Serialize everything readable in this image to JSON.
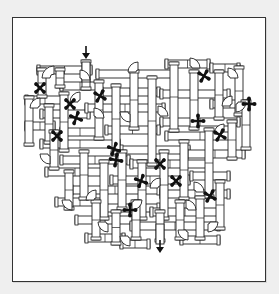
{
  "puzzle": {
    "type": "pipe-maze",
    "colors": {
      "background": "#efefef",
      "panel": "#ffffff",
      "border": "#333333",
      "ink": "#111111"
    },
    "entry_arrow": {
      "x": 86,
      "y": 52,
      "direction": "down"
    },
    "exit_arrow": {
      "x": 160,
      "y": 246,
      "direction": "down"
    },
    "pipes_horizontal": [
      [
        37,
        66,
        55,
        8
      ],
      [
        96,
        70,
        80,
        8
      ],
      [
        165,
        60,
        45,
        8
      ],
      [
        210,
        64,
        30,
        8
      ],
      [
        25,
        96,
        40,
        8
      ],
      [
        60,
        82,
        40,
        8
      ],
      [
        100,
        88,
        60,
        8
      ],
      [
        160,
        90,
        70,
        8
      ],
      [
        210,
        100,
        40,
        8
      ],
      [
        40,
        110,
        50,
        8
      ],
      [
        85,
        104,
        80,
        8
      ],
      [
        160,
        118,
        80,
        8
      ],
      [
        25,
        122,
        30,
        8
      ],
      [
        60,
        128,
        40,
        8
      ],
      [
        105,
        126,
        55,
        8
      ],
      [
        165,
        132,
        70,
        8
      ],
      [
        40,
        140,
        80,
        8
      ],
      [
        120,
        146,
        70,
        8
      ],
      [
        185,
        150,
        60,
        8
      ],
      [
        60,
        156,
        70,
        8
      ],
      [
        130,
        160,
        80,
        8
      ],
      [
        45,
        168,
        60,
        8
      ],
      [
        110,
        176,
        80,
        8
      ],
      [
        190,
        172,
        40,
        8
      ],
      [
        70,
        186,
        90,
        8
      ],
      [
        160,
        190,
        70,
        8
      ],
      [
        55,
        198,
        50,
        8
      ],
      [
        100,
        204,
        60,
        8
      ],
      [
        150,
        208,
        70,
        8
      ],
      [
        75,
        216,
        60,
        8
      ],
      [
        130,
        222,
        90,
        8
      ],
      [
        85,
        234,
        40,
        8
      ],
      [
        180,
        236,
        40,
        8
      ],
      [
        120,
        240,
        30,
        8
      ]
    ],
    "pipes_vertical": [
      [
        82,
        60,
        8,
        30
      ],
      [
        38,
        68,
        8,
        30
      ],
      [
        56,
        68,
        8,
        20
      ],
      [
        25,
        96,
        8,
        50
      ],
      [
        45,
        104,
        8,
        40
      ],
      [
        60,
        92,
        8,
        60
      ],
      [
        95,
        80,
        8,
        60
      ],
      [
        112,
        84,
        8,
        70
      ],
      [
        130,
        70,
        8,
        60
      ],
      [
        148,
        76,
        8,
        90
      ],
      [
        170,
        62,
        8,
        70
      ],
      [
        190,
        70,
        8,
        60
      ],
      [
        215,
        70,
        8,
        50
      ],
      [
        235,
        66,
        8,
        50
      ],
      [
        242,
        100,
        8,
        50
      ],
      [
        228,
        120,
        8,
        40
      ],
      [
        205,
        128,
        8,
        70
      ],
      [
        180,
        140,
        8,
        60
      ],
      [
        160,
        150,
        8,
        70
      ],
      [
        138,
        160,
        8,
        60
      ],
      [
        118,
        150,
        8,
        60
      ],
      [
        100,
        160,
        8,
        60
      ],
      [
        80,
        150,
        8,
        50
      ],
      [
        65,
        170,
        8,
        40
      ],
      [
        92,
        200,
        8,
        40
      ],
      [
        112,
        210,
        8,
        35
      ],
      [
        132,
        200,
        8,
        40
      ],
      [
        156,
        210,
        8,
        32
      ],
      [
        176,
        200,
        8,
        40
      ],
      [
        196,
        196,
        8,
        44
      ],
      [
        216,
        180,
        8,
        50
      ],
      [
        50,
        130,
        8,
        40
      ]
    ],
    "elbows": [
      [
        42,
        66,
        12,
        "tl"
      ],
      [
        90,
        70,
        10,
        "tr"
      ],
      [
        128,
        62,
        10,
        "tl"
      ],
      [
        200,
        58,
        10,
        "tr"
      ],
      [
        238,
        68,
        10,
        "tr"
      ],
      [
        30,
        98,
        10,
        "tl"
      ],
      [
        70,
        92,
        10,
        "tl"
      ],
      [
        104,
        108,
        10,
        "tr"
      ],
      [
        120,
        122,
        10,
        "bl"
      ],
      [
        214,
        124,
        10,
        "tl"
      ],
      [
        246,
        112,
        10,
        "br"
      ],
      [
        40,
        164,
        10,
        "bl"
      ],
      [
        86,
        190,
        10,
        "tl"
      ],
      [
        98,
        232,
        10,
        "bl"
      ],
      [
        120,
        246,
        10,
        "bl"
      ],
      [
        150,
        178,
        10,
        "tl"
      ],
      [
        204,
        182,
        10,
        "tr"
      ],
      [
        218,
        232,
        10,
        "br"
      ],
      [
        178,
        240,
        10,
        "bl"
      ],
      [
        196,
        200,
        10,
        "tr"
      ],
      [
        62,
        210,
        10,
        "bl"
      ],
      [
        142,
        210,
        10,
        "br"
      ],
      [
        168,
        106,
        10,
        "tr"
      ],
      [
        222,
        96,
        10,
        "tl"
      ]
    ],
    "fans": [
      {
        "x": 40,
        "y": 88,
        "rot": 45
      },
      {
        "x": 70,
        "y": 104,
        "rot": 45
      },
      {
        "x": 76,
        "y": 118,
        "rot": 20
      },
      {
        "x": 57,
        "y": 136,
        "rot": 45
      },
      {
        "x": 100,
        "y": 96,
        "rot": 30
      },
      {
        "x": 204,
        "y": 76,
        "rot": 30
      },
      {
        "x": 249,
        "y": 104,
        "rot": 0
      },
      {
        "x": 198,
        "y": 121,
        "rot": 0
      },
      {
        "x": 220,
        "y": 135,
        "rot": 30
      },
      {
        "x": 114,
        "y": 149,
        "rot": 20
      },
      {
        "x": 160,
        "y": 164,
        "rot": 45
      },
      {
        "x": 141,
        "y": 181,
        "rot": 20
      },
      {
        "x": 176,
        "y": 181,
        "rot": 45
      },
      {
        "x": 210,
        "y": 196,
        "rot": 30
      },
      {
        "x": 130,
        "y": 210,
        "rot": 0
      },
      {
        "x": 116,
        "y": 160,
        "rot": 10
      }
    ]
  }
}
